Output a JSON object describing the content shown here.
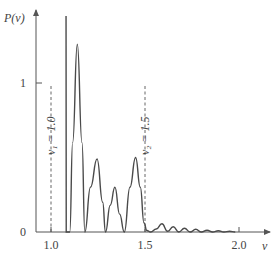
{
  "chart_data": {
    "type": "line",
    "title": "",
    "xlabel": "ν",
    "ylabel": "P(ν)",
    "xlim": [
      0.92,
      2.15
    ],
    "ylim": [
      0,
      1.5
    ],
    "x_ticks": [
      {
        "value": 1.0,
        "label": "1.0"
      },
      {
        "value": 1.5,
        "label": "1.5"
      },
      {
        "value": 2.0,
        "label": "2.0"
      }
    ],
    "y_ticks": [
      {
        "value": 0,
        "label": "0"
      },
      {
        "value": 1,
        "label": "1"
      }
    ],
    "grid": false,
    "annotations": [
      {
        "x": 1.0,
        "label": "ν₁ = 1.0",
        "style": "dashed-vertical"
      },
      {
        "x": 1.5,
        "label": "ν₂ = 1.5",
        "style": "dashed-vertical"
      }
    ],
    "series": [
      {
        "name": "P(ν)",
        "x": [
          1.08,
          1.081,
          1.1,
          1.115,
          1.14,
          1.165,
          1.18,
          1.21,
          1.245,
          1.275,
          1.29,
          1.315,
          1.34,
          1.365,
          1.39,
          1.42,
          1.45,
          1.475,
          1.495,
          1.51,
          1.53,
          1.56,
          1.59,
          1.62,
          1.65,
          1.68,
          1.71,
          1.74,
          1.77,
          1.8,
          1.83,
          1.86,
          1.89,
          1.92,
          1.95,
          1.98
        ],
        "y": [
          1.45,
          0.0,
          0.0,
          0.6,
          1.26,
          0.6,
          0.0,
          0.3,
          0.49,
          0.2,
          0.0,
          0.18,
          0.3,
          0.12,
          0.0,
          0.3,
          0.5,
          0.3,
          0.06,
          0.01,
          0.0,
          0.02,
          0.055,
          0.005,
          0.035,
          0.0,
          0.025,
          0.0,
          0.018,
          0.0,
          0.012,
          0.0,
          0.008,
          0.0,
          0.005,
          0.0
        ]
      }
    ]
  }
}
